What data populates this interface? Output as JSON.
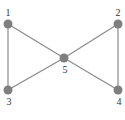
{
  "diagram": {
    "type": "graph",
    "node_color": "#7f7f7f",
    "edge_color": "#8a8a8a",
    "nodes": [
      {
        "id": "1",
        "label": "1",
        "x": 8,
        "y": 24,
        "lx": 8,
        "ly": 16
      },
      {
        "id": "2",
        "label": "2",
        "x": 118,
        "y": 24,
        "lx": 118,
        "ly": 16
      },
      {
        "id": "3",
        "label": "3",
        "x": 8,
        "y": 90,
        "lx": 9,
        "ly": 105
      },
      {
        "id": "4",
        "label": "4",
        "x": 118,
        "y": 90,
        "lx": 119,
        "ly": 105
      },
      {
        "id": "5",
        "label": "5",
        "x": 64,
        "y": 58,
        "lx": 65,
        "ly": 73
      }
    ],
    "edges": [
      [
        "1",
        "3"
      ],
      [
        "1",
        "5"
      ],
      [
        "3",
        "5"
      ],
      [
        "2",
        "5"
      ],
      [
        "4",
        "5"
      ],
      [
        "2",
        "4"
      ]
    ]
  }
}
